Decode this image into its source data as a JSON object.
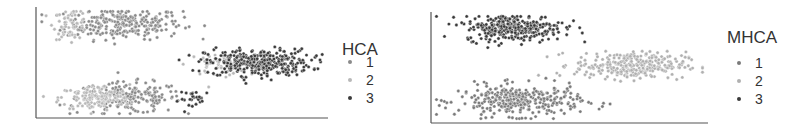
{
  "chart_data": [
    {
      "type": "scatter",
      "title": "",
      "xlabel": "",
      "ylabel": "",
      "grid": false,
      "axes": {
        "x_ticks": false,
        "y_ticks": false
      },
      "legend": {
        "title": "HCA",
        "position": "right",
        "entries": [
          "1",
          "2",
          "3"
        ]
      },
      "series": [
        {
          "name": "1",
          "color": "#8a8a8a",
          "clusters": [
            {
              "cx": 0.3,
              "cy": 0.85,
              "sx": 0.1,
              "sy": 0.07,
              "n": 260
            },
            {
              "cx": 0.32,
              "cy": 0.18,
              "sx": 0.09,
              "sy": 0.07,
              "n": 200
            }
          ]
        },
        {
          "name": "2",
          "color": "#b8b8b8",
          "clusters": [
            {
              "cx": 0.12,
              "cy": 0.85,
              "sx": 0.03,
              "sy": 0.07,
              "n": 60
            },
            {
              "cx": 0.62,
              "cy": 0.48,
              "sx": 0.05,
              "sy": 0.05,
              "n": 50
            },
            {
              "cx": 0.2,
              "cy": 0.18,
              "sx": 0.06,
              "sy": 0.06,
              "n": 130
            }
          ]
        },
        {
          "name": "3",
          "color": "#3a3a3a",
          "clusters": [
            {
              "cx": 0.76,
              "cy": 0.5,
              "sx": 0.09,
              "sy": 0.06,
              "n": 330
            },
            {
              "cx": 0.55,
              "cy": 0.17,
              "sx": 0.03,
              "sy": 0.04,
              "n": 25
            }
          ]
        }
      ]
    },
    {
      "type": "scatter",
      "title": "",
      "xlabel": "",
      "ylabel": "",
      "grid": false,
      "axes": {
        "x_ticks": false,
        "y_ticks": false
      },
      "legend": {
        "title": "MHCA",
        "position": "right",
        "entries": [
          "1",
          "2",
          "3"
        ]
      },
      "series": [
        {
          "name": "1",
          "color": "#7a7a7a",
          "clusters": [
            {
              "cx": 0.32,
              "cy": 0.2,
              "sx": 0.11,
              "sy": 0.07,
              "n": 330
            }
          ]
        },
        {
          "name": "2",
          "color": "#b0b0b0",
          "clusters": [
            {
              "cx": 0.72,
              "cy": 0.52,
              "sx": 0.1,
              "sy": 0.06,
              "n": 300
            }
          ]
        },
        {
          "name": "3",
          "color": "#3a3a3a",
          "clusters": [
            {
              "cx": 0.3,
              "cy": 0.86,
              "sx": 0.09,
              "sy": 0.06,
              "n": 320
            }
          ]
        }
      ]
    }
  ],
  "legends": [
    {
      "title": "HCA",
      "items": [
        {
          "label": "1",
          "color": "#8a8a8a"
        },
        {
          "label": "2",
          "color": "#b8b8b8"
        },
        {
          "label": "3",
          "color": "#3a3a3a"
        }
      ]
    },
    {
      "title": "MHCA",
      "items": [
        {
          "label": "1",
          "color": "#7a7a7a"
        },
        {
          "label": "2",
          "color": "#b0b0b0"
        },
        {
          "label": "3",
          "color": "#3a3a3a"
        }
      ]
    }
  ]
}
